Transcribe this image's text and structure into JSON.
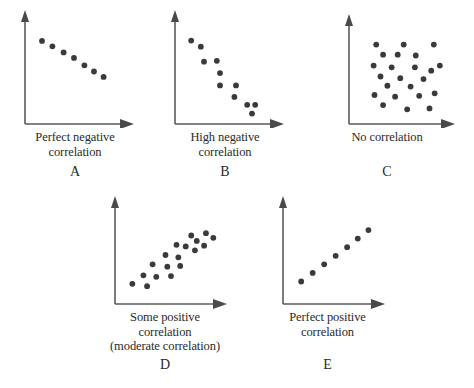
{
  "figure": {
    "background_color": "#ffffff",
    "dot_color": "#3a3a3a",
    "axis_color": "#5a5a5a",
    "text_color": "#2a2a2a"
  },
  "panels": [
    {
      "letter": "A",
      "caption_lines": [
        "Perfect negative",
        "correlation"
      ],
      "caption_text": "Perfect negative correlation"
    },
    {
      "letter": "B",
      "caption_lines": [
        "High negative",
        "correlation"
      ],
      "caption_text": "High negative correlation"
    },
    {
      "letter": "C",
      "caption_lines": [
        "No correlation"
      ],
      "caption_text": "No correlation"
    },
    {
      "letter": "D",
      "caption_lines": [
        "Some positive",
        "correlation",
        "(moderate correlation)"
      ],
      "caption_text": "Some positive correlation (moderate correlation)"
    },
    {
      "letter": "E",
      "caption_lines": [
        "Perfect positive",
        "correlation"
      ],
      "caption_text": "Perfect positive correlation"
    }
  ],
  "chart_data": [
    {
      "id": "A",
      "type": "scatter",
      "title": "Perfect negative correlation",
      "xlabel": "",
      "ylabel": "",
      "xlim": [
        0,
        100
      ],
      "ylim": [
        0,
        100
      ],
      "grid": false,
      "legend": "none",
      "n_points": 7,
      "points": [
        {
          "x": 10,
          "y": 84
        },
        {
          "x": 23,
          "y": 76
        },
        {
          "x": 37,
          "y": 67
        },
        {
          "x": 50,
          "y": 59
        },
        {
          "x": 63,
          "y": 48
        },
        {
          "x": 75,
          "y": 39
        },
        {
          "x": 87,
          "y": 31
        }
      ]
    },
    {
      "id": "B",
      "type": "scatter",
      "title": "High negative correlation",
      "xlabel": "",
      "ylabel": "",
      "xlim": [
        0,
        100
      ],
      "ylim": [
        0,
        100
      ],
      "grid": false,
      "legend": "none",
      "n_points": 11,
      "points": [
        {
          "x": 9,
          "y": 88
        },
        {
          "x": 21,
          "y": 81
        },
        {
          "x": 25,
          "y": 64
        },
        {
          "x": 41,
          "y": 65
        },
        {
          "x": 45,
          "y": 51
        },
        {
          "x": 45,
          "y": 37
        },
        {
          "x": 65,
          "y": 37
        },
        {
          "x": 63,
          "y": 24
        },
        {
          "x": 79,
          "y": 15
        },
        {
          "x": 89,
          "y": 15
        },
        {
          "x": 85,
          "y": 5
        }
      ]
    },
    {
      "id": "C",
      "type": "scatter",
      "title": "No correlation",
      "xlabel": "",
      "ylabel": "",
      "xlim": [
        0,
        100
      ],
      "ylim": [
        0,
        100
      ],
      "grid": false,
      "legend": "none",
      "n_points": 22,
      "points": [
        {
          "x": 20,
          "y": 85
        },
        {
          "x": 52,
          "y": 85
        },
        {
          "x": 87,
          "y": 85
        },
        {
          "x": 28,
          "y": 73
        },
        {
          "x": 45,
          "y": 73
        },
        {
          "x": 66,
          "y": 72
        },
        {
          "x": 17,
          "y": 60
        },
        {
          "x": 38,
          "y": 58
        },
        {
          "x": 65,
          "y": 58
        },
        {
          "x": 84,
          "y": 54
        },
        {
          "x": 94,
          "y": 60
        },
        {
          "x": 25,
          "y": 47
        },
        {
          "x": 48,
          "y": 45
        },
        {
          "x": 75,
          "y": 44
        },
        {
          "x": 33,
          "y": 36
        },
        {
          "x": 60,
          "y": 35
        },
        {
          "x": 18,
          "y": 25
        },
        {
          "x": 42,
          "y": 23
        },
        {
          "x": 70,
          "y": 24
        },
        {
          "x": 88,
          "y": 27
        },
        {
          "x": 28,
          "y": 13
        },
        {
          "x": 56,
          "y": 8
        },
        {
          "x": 82,
          "y": 9
        }
      ]
    },
    {
      "id": "D",
      "type": "scatter",
      "title": "Some positive correlation (moderate correlation)",
      "xlabel": "",
      "ylabel": "",
      "xlim": [
        0,
        100
      ],
      "ylim": [
        0,
        100
      ],
      "grid": false,
      "legend": "none",
      "n_points": 18,
      "points": [
        {
          "x": 8,
          "y": 13
        },
        {
          "x": 24,
          "y": 10
        },
        {
          "x": 20,
          "y": 24
        },
        {
          "x": 34,
          "y": 22
        },
        {
          "x": 30,
          "y": 38
        },
        {
          "x": 46,
          "y": 35
        },
        {
          "x": 44,
          "y": 50
        },
        {
          "x": 50,
          "y": 23
        },
        {
          "x": 58,
          "y": 47
        },
        {
          "x": 60,
          "y": 36
        },
        {
          "x": 56,
          "y": 63
        },
        {
          "x": 66,
          "y": 61
        },
        {
          "x": 72,
          "y": 75
        },
        {
          "x": 76,
          "y": 56
        },
        {
          "x": 78,
          "y": 68
        },
        {
          "x": 86,
          "y": 62
        },
        {
          "x": 88,
          "y": 78
        },
        {
          "x": 96,
          "y": 72
        }
      ]
    },
    {
      "id": "E",
      "type": "scatter",
      "title": "Perfect positive correlation",
      "xlabel": "",
      "ylabel": "",
      "xlim": [
        0,
        100
      ],
      "ylim": [
        0,
        100
      ],
      "grid": false,
      "legend": "none",
      "n_points": 7,
      "points": [
        {
          "x": 10,
          "y": 16
        },
        {
          "x": 24,
          "y": 27
        },
        {
          "x": 38,
          "y": 38
        },
        {
          "x": 52,
          "y": 49
        },
        {
          "x": 66,
          "y": 60
        },
        {
          "x": 79,
          "y": 71
        },
        {
          "x": 92,
          "y": 82
        }
      ]
    }
  ]
}
